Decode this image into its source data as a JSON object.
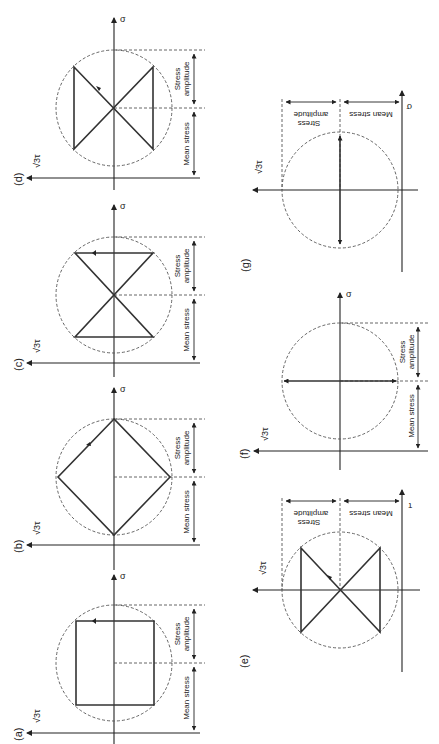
{
  "figure": {
    "axis_labels": {
      "sigma": "σ",
      "tau": "√3τ",
      "tau_alt": "τ"
    },
    "dimension_labels": {
      "mean_stress": "Mean stress",
      "stress_amplitude_line1": "Stress",
      "stress_amplitude_line2": "amplitude"
    },
    "panels": [
      {
        "id": "a",
        "label": "(a)",
        "shape": "square",
        "orientation": "left-column"
      },
      {
        "id": "b",
        "label": "(b)",
        "shape": "diamond",
        "orientation": "left-column"
      },
      {
        "id": "c",
        "label": "(c)",
        "shape": "hourglass",
        "orientation": "left-column"
      },
      {
        "id": "d",
        "label": "(d)",
        "shape": "bowtie",
        "orientation": "left-column"
      },
      {
        "id": "e",
        "label": "(e)",
        "shape": "bowtie",
        "orientation": "right-column-inverted"
      },
      {
        "id": "f",
        "label": "(f)",
        "shape": "horizontal-double-arrow",
        "orientation": "right-column"
      },
      {
        "id": "g",
        "label": "(g)",
        "shape": "vertical-double-arrow",
        "orientation": "right-column-inverted"
      }
    ]
  }
}
